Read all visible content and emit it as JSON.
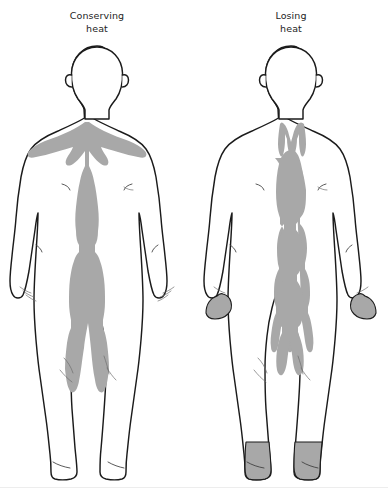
{
  "illustration": {
    "title_left": "Conserving heat",
    "title_right": "Losing heat",
    "background_color": "#ffffff",
    "outline_color": "#1b1b1b",
    "heat_shade_color": "#a8a8a8",
    "caption_color": "#242424"
  },
  "panels": [
    {
      "id": "conserving-heat",
      "caption": "Conserving\nheat",
      "caption_line_1": "Conserving",
      "caption_line_2": "heat",
      "figure_label": "human-body-front-view",
      "shaded_regions": [
        "clavicle-shoulders",
        "chest",
        "abdomen",
        "pelvis",
        "upper-thighs"
      ],
      "unshaded_regions": [
        "head",
        "arms",
        "hands",
        "lower-legs",
        "feet"
      ],
      "hands_shaded": "no",
      "feet_shaded": "no"
    },
    {
      "id": "losing-heat",
      "caption": "Losing\nheat",
      "caption_line_1": "Losing",
      "caption_line_2": "heat",
      "figure_label": "human-body-front-view",
      "shaded_regions": [
        "neck-fork",
        "central-chest-column",
        "narrow-abdomen",
        "groin",
        "hands",
        "feet-ankles"
      ],
      "unshaded_regions": [
        "head",
        "shoulders",
        "outer-chest",
        "arms",
        "thighs",
        "lower-legs"
      ],
      "hands_shaded": "yes",
      "feet_shaded": "yes"
    }
  ]
}
